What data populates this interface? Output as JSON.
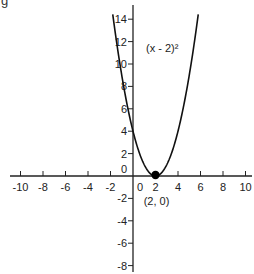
{
  "corner_text": "g",
  "chart_data": {
    "type": "line",
    "title": "",
    "xlabel": "",
    "ylabel": "",
    "function": "(x - 2)^2",
    "xlim": [
      -10.5,
      10.5
    ],
    "ylim": [
      -8.5,
      15
    ],
    "x_ticks": [
      -10,
      -8,
      -6,
      -4,
      -2,
      0,
      2,
      4,
      6,
      8,
      10
    ],
    "y_ticks": [
      14,
      12,
      10,
      8,
      6,
      4,
      2,
      0,
      -2,
      -4,
      -6,
      -8
    ],
    "grid": false,
    "series": [
      {
        "name": "(x - 2)²",
        "x": [
          -1.8,
          -1.5,
          -1,
          -0.5,
          0,
          0.5,
          1,
          1.5,
          2,
          2.5,
          3,
          3.5,
          4,
          4.5,
          5,
          5.5,
          5.8
        ],
        "values": [
          14.44,
          12.25,
          9,
          6.25,
          4,
          2.25,
          1,
          0.25,
          0,
          0.25,
          1,
          2.25,
          4,
          6.25,
          9,
          12.25,
          14.44
        ]
      }
    ],
    "annotations": [
      {
        "text": "(x - 2)²",
        "x": 3,
        "y": 11
      },
      {
        "text": "(2, 0)",
        "x": 2,
        "y": -2,
        "marker_point": [
          2,
          0
        ]
      }
    ],
    "colors": {
      "curve": "#111111",
      "axes": "#222222",
      "point": "#000000"
    }
  }
}
